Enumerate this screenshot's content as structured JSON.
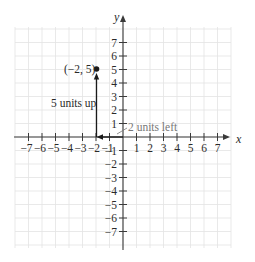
{
  "figure": {
    "type": "coordinate-plane",
    "x_axis_label": "x",
    "y_axis_label": "y",
    "x_range": [
      -7,
      7
    ],
    "y_range": [
      -7,
      7
    ],
    "x_tick_labels": [
      "−7",
      "−6",
      "−5",
      "−4",
      "−3",
      "−2",
      "−1",
      "1",
      "2",
      "3",
      "4",
      "5",
      "6",
      "7"
    ],
    "y_tick_labels": [
      "7",
      "6",
      "5",
      "4",
      "3",
      "2",
      "1",
      "−1",
      "−2",
      "−3",
      "−4",
      "−5",
      "−6",
      "−7"
    ],
    "grid": true
  },
  "point": {
    "label": "(−2, 5)",
    "x": -2,
    "y": 5
  },
  "annotations": {
    "vertical_move": "5 units up",
    "horizontal_move": "2 units left"
  },
  "colors": {
    "axis": "#3a3a3a",
    "grid": "#e3e3e3",
    "point": "#1a1a1a",
    "leader_label": "#777777"
  }
}
